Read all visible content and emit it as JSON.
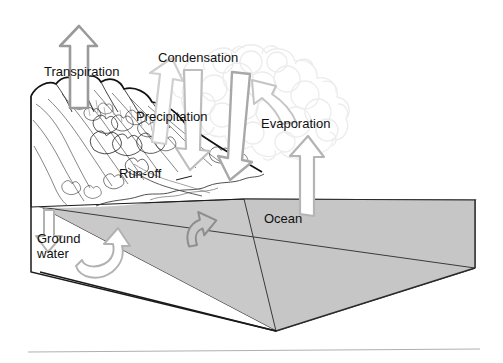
{
  "figure": {
    "type": "diagram",
    "background_color": "#ffffff"
  },
  "labels": {
    "transpiration": "Transpiration",
    "condensation": "Condensation",
    "precipitation": "Precipitation",
    "evaporation": "Evaporation",
    "runoff": "Run-off",
    "ocean": "Ocean",
    "groundwater": "Ground\nwater"
  },
  "colors": {
    "ocean_fill": "#c9c9c9",
    "ocean_fill_dark": "#bcbcbc",
    "outline": "#1a1a1a",
    "arrow_stroke": "#9a9a9a",
    "arrow_fill": "#ffffff",
    "cloud_stroke": "#ececec",
    "terrain_stroke": "#4a4a4a",
    "footer_rule": "#b0b0b0",
    "text": "#101010"
  },
  "elements": {
    "cloud": "cloud-shape",
    "mountain": "mountain-landmass",
    "ocean_block": "ocean-3d-block",
    "footer_rule": "horizontal-rule",
    "arrows": [
      {
        "name": "transpiration-arrow",
        "direction": "up",
        "from": "vegetation",
        "to": "atmosphere"
      },
      {
        "name": "condensation-arrow",
        "direction": "up-right",
        "from": "atmosphere",
        "to": "cloud"
      },
      {
        "name": "precipitation-arrow-left",
        "direction": "down",
        "from": "cloud",
        "to": "mountain"
      },
      {
        "name": "precipitation-arrow-right",
        "direction": "down",
        "from": "cloud",
        "to": "coast"
      },
      {
        "name": "evaporation-arrow-upper",
        "direction": "up-left",
        "from": "ocean-vapour",
        "to": "cloud"
      },
      {
        "name": "evaporation-arrow-lower",
        "direction": "up",
        "from": "ocean",
        "to": "atmosphere"
      },
      {
        "name": "runoff-arrow",
        "direction": "up-curved",
        "from": "coastal-water",
        "to": "ocean"
      },
      {
        "name": "groundwater-arrow-left",
        "direction": "down",
        "from": "surface",
        "to": "aquifer"
      },
      {
        "name": "groundwater-arrow-right",
        "direction": "curve-up-right",
        "from": "aquifer",
        "to": "ocean"
      }
    ]
  }
}
